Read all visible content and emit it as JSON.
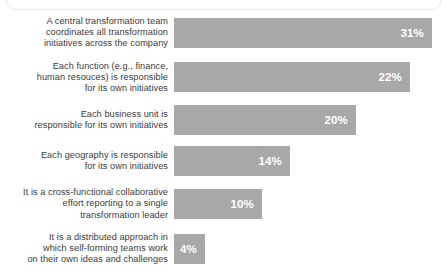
{
  "chart_data": {
    "type": "bar",
    "orientation": "horizontal",
    "title": "",
    "subtitle": "",
    "xlabel": "",
    "ylabel": "",
    "value_suffix": "%",
    "grid": false,
    "legend": null,
    "axis_visible": false,
    "xlim": [
      0,
      31
    ],
    "bar_color": "#a8a8a8",
    "value_label_color": "#ffffff",
    "category_label_color": "#3b3b3b",
    "categories": [
      "A central transformation team coordinates all transformation initiatives across the company",
      "Each function (e.g., finance, human resouces) is responsible for its own initiatives",
      "Each business unit is responsible for its own initiatives",
      "Each geography is responsible for its own initiatives",
      "It is a cross-functional collaborative effort reporting to a single transformation leader",
      "It is a distributed approach in which self-forming teams work on their own ideas and challenges"
    ],
    "values": [
      31,
      22,
      20,
      14,
      10,
      4
    ],
    "value_labels": [
      "31%",
      "22%",
      "20%",
      "14%",
      "10%",
      "4%"
    ],
    "bar_pixel_widths": [
      258,
      236,
      182,
      116,
      88,
      31
    ],
    "rows": [
      {
        "label_lines": [
          "A central transformation team",
          "coordinates all transformation",
          "initiatives across the company"
        ],
        "value": 31,
        "value_label": "31%",
        "bar_width_px": 258
      },
      {
        "label_lines": [
          "Each function (e.g., finance,",
          "human resouces) is responsible",
          "for its own initiatives"
        ],
        "value": 22,
        "value_label": "22%",
        "bar_width_px": 236
      },
      {
        "label_lines": [
          "Each business unit is",
          "responsible for its own initiatives"
        ],
        "value": 20,
        "value_label": "20%",
        "bar_width_px": 182
      },
      {
        "label_lines": [
          "Each geography is responsible",
          "for its own initiatives"
        ],
        "value": 14,
        "value_label": "14%",
        "bar_width_px": 116
      },
      {
        "label_lines": [
          "It is a cross-functional collaborative",
          "effort reporting to a single",
          "transformation leader"
        ],
        "value": 10,
        "value_label": "10%",
        "bar_width_px": 88
      },
      {
        "label_lines": [
          "It is a distributed approach in",
          "which self-forming teams work",
          "on their own ideas and challenges"
        ],
        "value": 4,
        "value_label": "4%",
        "bar_width_px": 31
      }
    ]
  }
}
